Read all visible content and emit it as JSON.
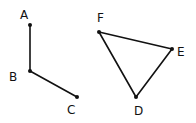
{
  "diagram": {
    "style": "hand-drawn sketch",
    "stroke_color": "#111111",
    "background": "#ffffff",
    "figures": [
      {
        "name": "open-polyline",
        "points": [
          {
            "id": "A",
            "label": "A",
            "x": 30,
            "y": 25,
            "lx": 20,
            "ly": 19
          },
          {
            "id": "B",
            "label": "B",
            "x": 30,
            "y": 71,
            "lx": 9,
            "ly": 81
          },
          {
            "id": "C",
            "label": "C",
            "x": 77,
            "y": 97,
            "lx": 67,
            "ly": 114
          }
        ],
        "segments": [
          [
            "A",
            "B"
          ],
          [
            "B",
            "C"
          ]
        ]
      },
      {
        "name": "triangle",
        "points": [
          {
            "id": "F",
            "label": "F",
            "x": 99,
            "y": 32,
            "lx": 97,
            "ly": 22
          },
          {
            "id": "E",
            "label": "E",
            "x": 172,
            "y": 49,
            "lx": 177,
            "ly": 56
          },
          {
            "id": "D",
            "label": "D",
            "x": 136,
            "y": 97,
            "lx": 134,
            "ly": 115
          }
        ],
        "segments": [
          [
            "F",
            "E"
          ],
          [
            "E",
            "D"
          ],
          [
            "D",
            "F"
          ]
        ]
      }
    ]
  }
}
